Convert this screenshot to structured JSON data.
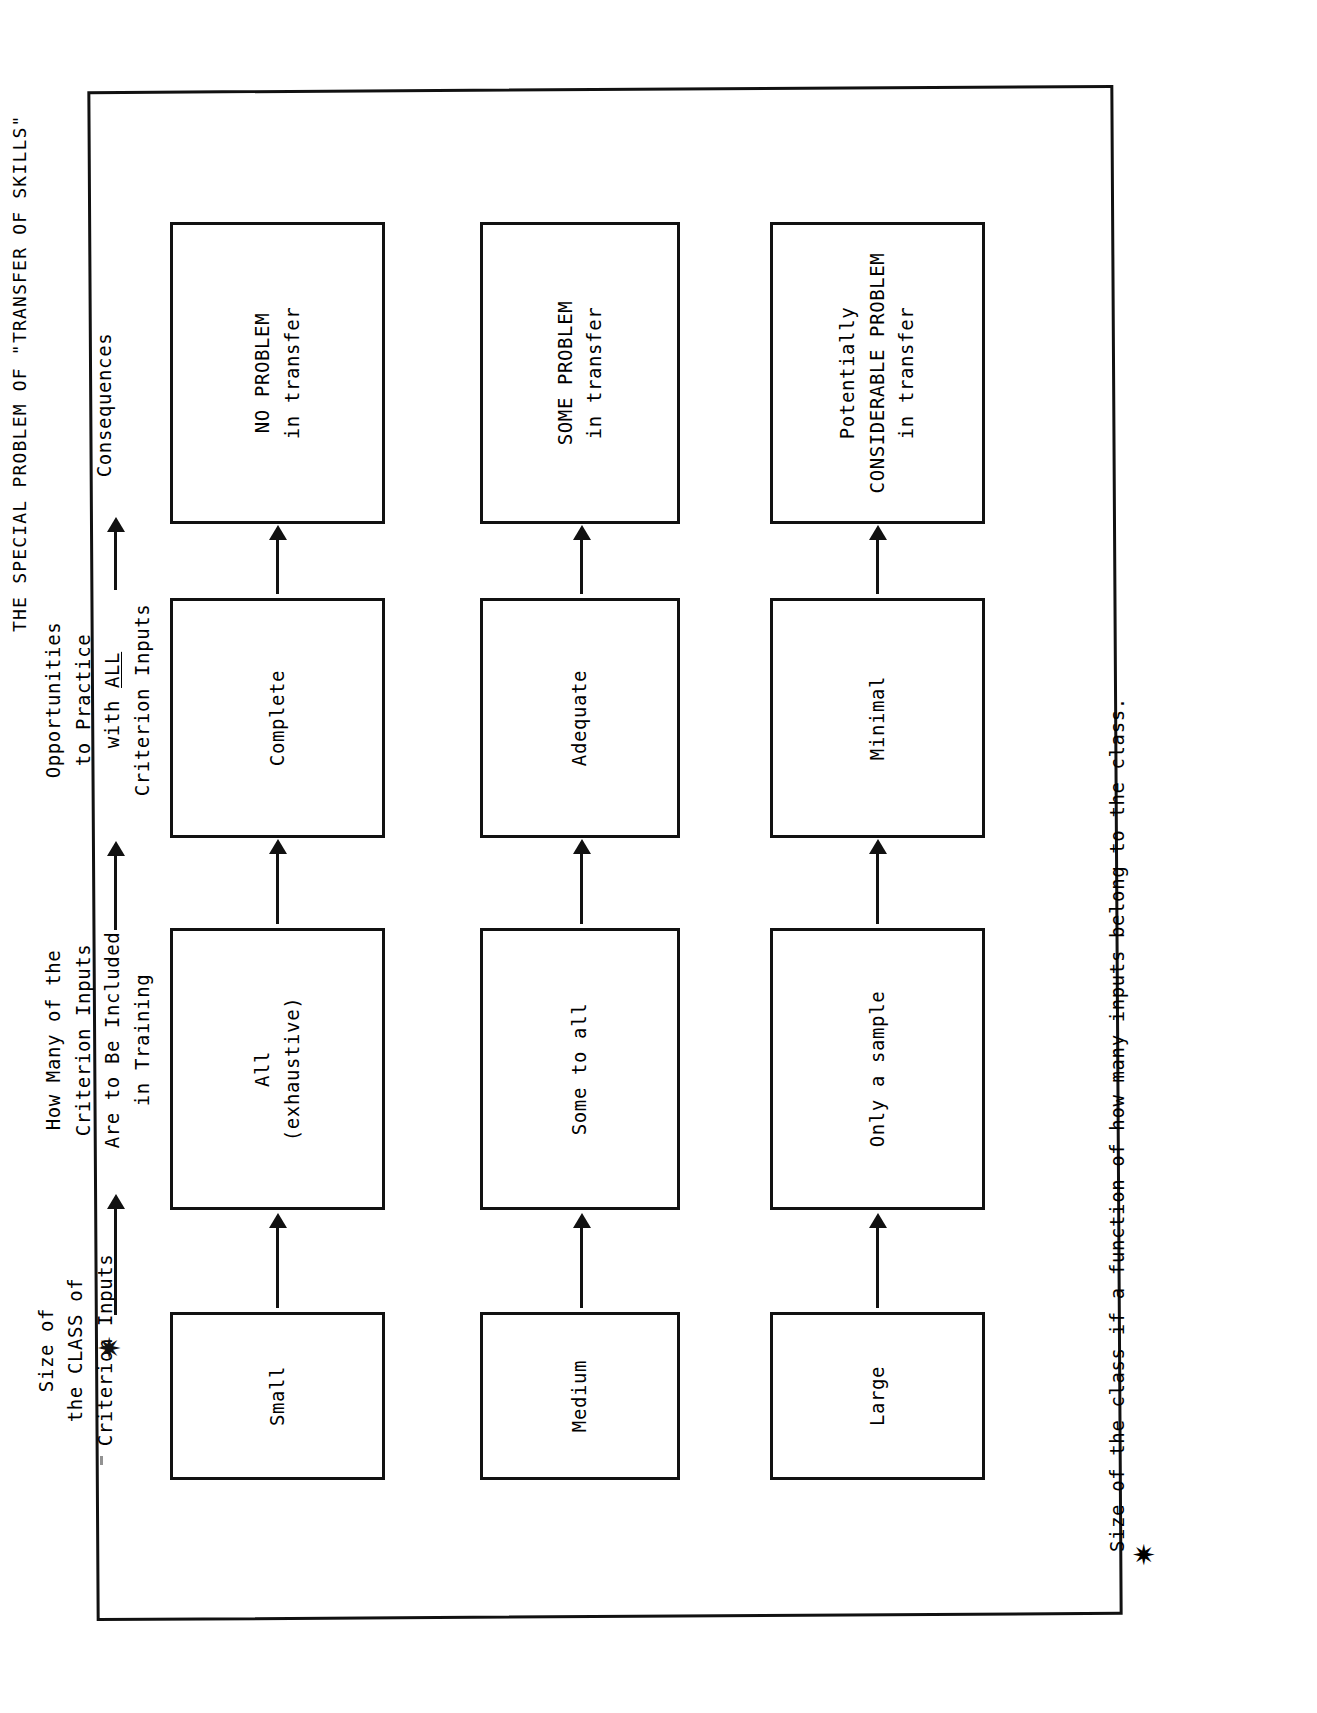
{
  "page": {
    "title": "THE SPECIAL PROBLEM OF \"TRANSFER OF SKILLS\"",
    "background_color": "#ffffff",
    "ink_color": "#111111"
  },
  "column_labels": {
    "class_size": "Size of\nthe CLASS of\nCriterion Inputs",
    "how_many": "How Many of the\nCriterion Inputs\nAre to Be Included\nin Training",
    "opportunities_pre": "Opportunities\nto Practice\nwith ",
    "opportunities_emphasis": "ALL",
    "opportunities_post": "\nCriterion Inputs",
    "consequences": "Consequences"
  },
  "rows": [
    {
      "id": "row-small",
      "class_size": "Small",
      "how_many": "All\n(exhaustive)",
      "opportunities": "Complete",
      "consequence": "NO PROBLEM\nin transfer"
    },
    {
      "id": "row-medium",
      "class_size": "Medium",
      "how_many": "Some to all",
      "opportunities": "Adequate",
      "consequence": "SOME PROBLEM\nin transfer"
    },
    {
      "id": "row-large",
      "class_size": "Large",
      "how_many": "Only a sample",
      "opportunities": "Minimal",
      "consequence": "Potentially\nCONSIDERABLE PROBLEM\nin transfer"
    }
  ],
  "markers": {
    "star_glyph": "✷"
  },
  "footnote": {
    "star_glyph": "✷",
    "text": "Size of the class if a function of how many inputs belong to the class."
  }
}
